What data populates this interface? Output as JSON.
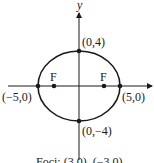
{
  "diagram": {
    "type": "ellipse-graph",
    "axis_labels": {
      "y": "y"
    },
    "points": {
      "top": "(0,4)",
      "bottom": "(0,−4)",
      "left": "(−5,0)",
      "right": "(5,0)"
    },
    "foci_markers": {
      "left": "F",
      "right": "F"
    },
    "caption": "Foci: (3,0), (−3,0)",
    "colors": {
      "ink": "#1a1a1a",
      "background": "#ffffff"
    }
  }
}
